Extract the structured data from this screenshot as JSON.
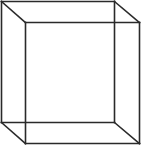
{
  "diagram": {
    "type": "wireframe-cube",
    "stroke_color": "#2a2a2a",
    "background": "#ffffff",
    "stroke_width": 1.6,
    "back_face": {
      "tl": [
        1,
        1
      ],
      "tr": [
        114,
        1
      ],
      "br": [
        114,
        122
      ],
      "bl": [
        1,
        122
      ]
    },
    "front_face": {
      "tl": [
        25,
        22
      ],
      "tr": [
        139,
        22
      ],
      "br": [
        139,
        143
      ],
      "bl": [
        25,
        143
      ]
    }
  }
}
